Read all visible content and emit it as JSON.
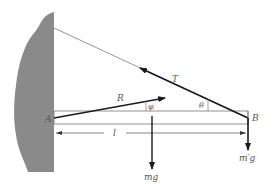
{
  "diagram": {
    "colors": {
      "wall": "#8a8a8a",
      "line": "#1a1a1a",
      "thin_line": "#777777",
      "label": "#555555",
      "background": "#ffffff"
    },
    "labels": {
      "tension": "T",
      "reaction": "R",
      "phi": "φ",
      "theta": "θ",
      "point_a": "A",
      "point_b": "B",
      "length": "l",
      "beam_weight": "mg",
      "load_weight": "m′g"
    },
    "elements": {
      "wall": "hatched-wall",
      "beam": "horizontal-beam",
      "rope": "support-rope",
      "tension_arrow": "T-arrow",
      "reaction_arrow": "R-arrow",
      "length_dimension": "l-dimension",
      "beam_weight_arrow": "mg-arrow",
      "load_weight_arrow": "m'g-arrow"
    }
  }
}
